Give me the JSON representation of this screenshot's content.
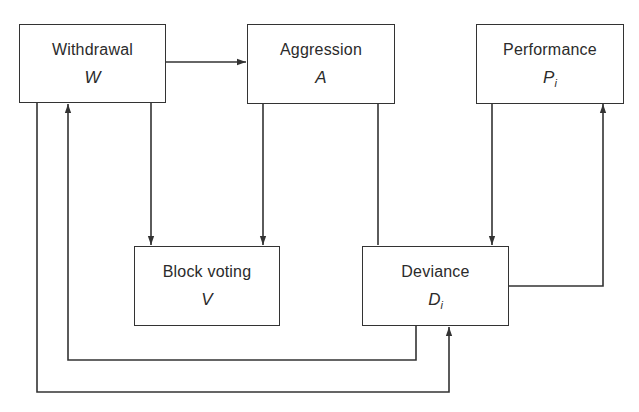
{
  "diagram": {
    "nodes": [
      {
        "id": "withdrawal",
        "label": "Withdrawal",
        "symbol": "W",
        "subscript": ""
      },
      {
        "id": "aggression",
        "label": "Aggression",
        "symbol": "A",
        "subscript": ""
      },
      {
        "id": "performance",
        "label": "Performance",
        "symbol": "P",
        "subscript": "i"
      },
      {
        "id": "block_voting",
        "label": "Block voting",
        "symbol": "V",
        "subscript": ""
      },
      {
        "id": "deviance",
        "label": "Deviance",
        "symbol": "D",
        "subscript": "i"
      }
    ],
    "edges": [
      {
        "from": "withdrawal",
        "to": "aggression"
      },
      {
        "from": "withdrawal",
        "to": "block_voting"
      },
      {
        "from": "aggression",
        "to": "block_voting"
      },
      {
        "from": "aggression",
        "to": "deviance"
      },
      {
        "from": "performance",
        "to": "deviance"
      },
      {
        "from": "deviance",
        "to": "performance"
      },
      {
        "from": "deviance",
        "to": "withdrawal"
      },
      {
        "from": "withdrawal",
        "to": "deviance"
      }
    ],
    "colors": {
      "line": "#333333",
      "text": "#2b2b2b",
      "background": "#ffffff"
    }
  }
}
